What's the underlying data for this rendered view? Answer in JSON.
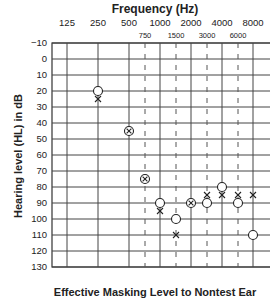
{
  "chart_data": {
    "type": "scatter",
    "title": "Frequency (Hz)",
    "xlabel": "Frequency (Hz)",
    "ylabel": "Hearing level (HL) in dB",
    "footer": "Effective Masking Level to Nontest Ear",
    "x_major_ticks": [
      "125",
      "250",
      "500",
      "1000",
      "2000",
      "4000",
      "8000"
    ],
    "x_minor_ticks": [
      "750",
      "1500",
      "3000",
      "6000"
    ],
    "y_ticks": [
      "-10",
      "0",
      "10",
      "20",
      "30",
      "40",
      "50",
      "60",
      "70",
      "80",
      "90",
      "100",
      "110",
      "120",
      "130"
    ],
    "ylim": [
      -10,
      130
    ],
    "y_inverted": true,
    "grid": true,
    "series": [
      {
        "name": "Right ear (O)",
        "symbol": "circle",
        "points": [
          {
            "x": "250",
            "y": 20
          },
          {
            "x": "1000",
            "y": 90
          },
          {
            "x": "1500",
            "y": 100
          },
          {
            "x": "3000",
            "y": 90
          },
          {
            "x": "4000",
            "y": 80
          },
          {
            "x": "6000",
            "y": 90
          },
          {
            "x": "8000",
            "y": 110
          }
        ]
      },
      {
        "name": "Left ear (X)",
        "symbol": "cross",
        "points": [
          {
            "x": "250",
            "y": 25
          },
          {
            "x": "1000",
            "y": 95
          },
          {
            "x": "1500",
            "y": 110
          },
          {
            "x": "3000",
            "y": 85
          },
          {
            "x": "4000",
            "y": 85
          },
          {
            "x": "6000",
            "y": 85
          },
          {
            "x": "8000",
            "y": 85
          }
        ]
      },
      {
        "name": "Both ears (⊗)",
        "symbol": "circle-cross",
        "points": [
          {
            "x": "500",
            "y": 45
          },
          {
            "x": "750",
            "y": 75
          },
          {
            "x": "2000",
            "y": 90
          }
        ]
      }
    ]
  }
}
